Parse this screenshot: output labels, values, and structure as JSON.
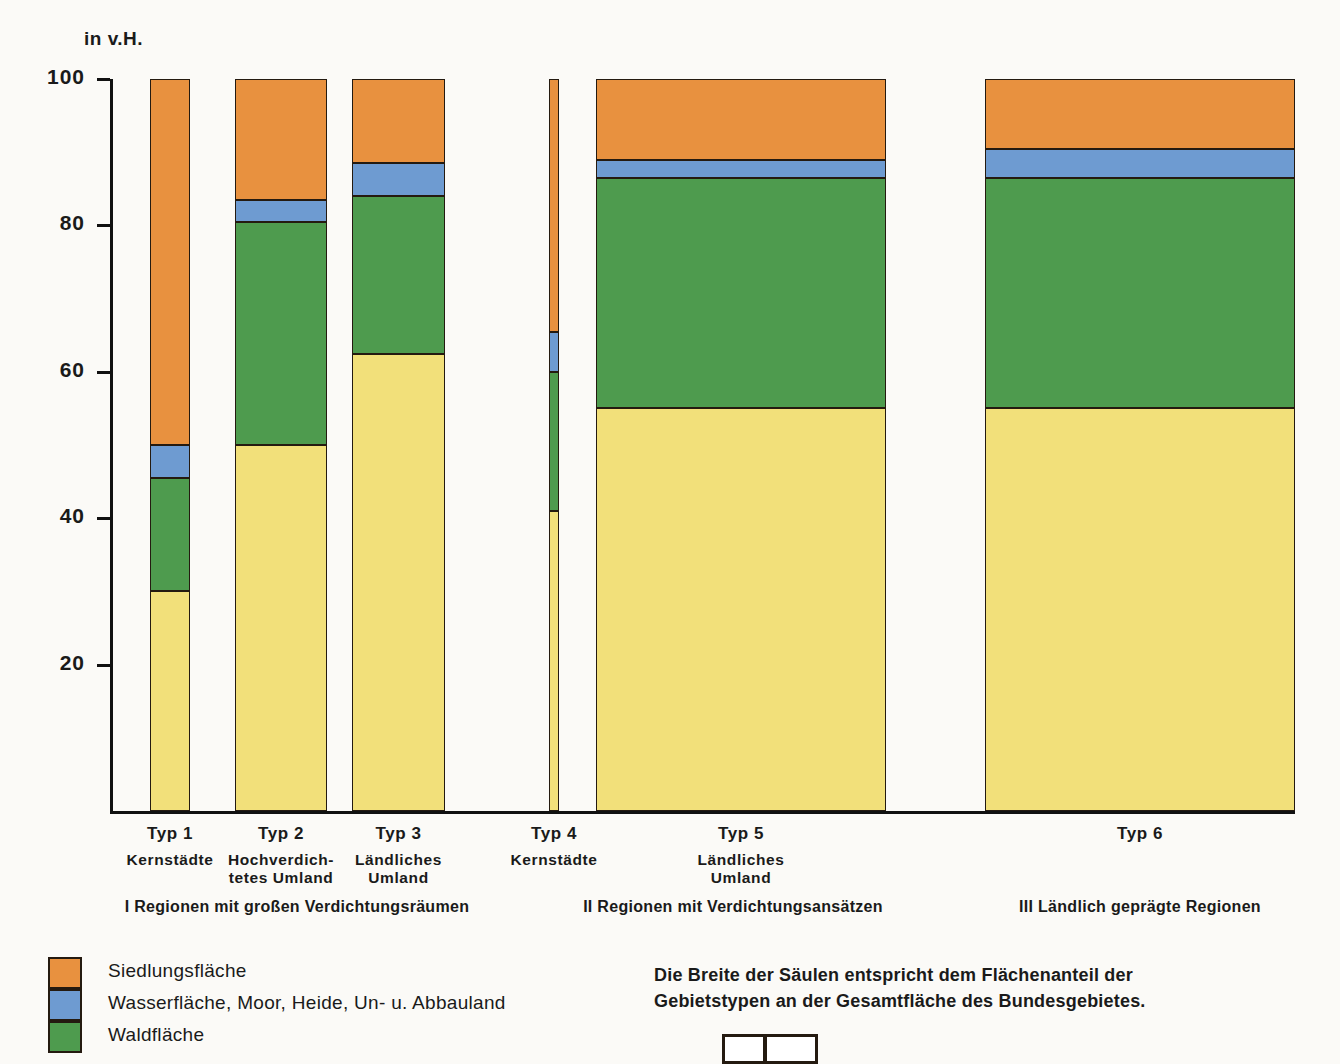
{
  "axis": {
    "unit_label": "in v.H.",
    "y_ticks": [
      "100",
      "80",
      "60",
      "40",
      "20"
    ],
    "y_min": 0,
    "y_max": 100
  },
  "legend": {
    "items": [
      {
        "label": "Siedlungsfläche",
        "color": "#E8913F",
        "key": "siedlung"
      },
      {
        "label": "Wasserfläche, Moor, Heide, Un- u. Abbauland",
        "color": "#6E9BD1",
        "key": "wasser"
      },
      {
        "label": "Waldfläche",
        "color": "#4E9B4E",
        "key": "wald"
      }
    ]
  },
  "note": {
    "text": "Die Breite der Säulen entspricht dem Flächenanteil der\nGebietstypen an der Gesamtfläche des Bundesgebietes."
  },
  "groups": [
    {
      "label": "I Regionen mit großen Verdichtungsräumen"
    },
    {
      "label": "II Regionen mit Verdichtungsansätzen"
    },
    {
      "label": "III Ländlich geprägte Regionen"
    }
  ],
  "chart_data": {
    "type": "bar",
    "title": "",
    "subtitle": "",
    "xlabel": "",
    "ylabel": "in v.H.",
    "ylim": [
      0,
      100
    ],
    "grid": false,
    "legend_position": "bottom-left",
    "stacked": true,
    "variable_bar_width": true,
    "width_meaning": "Die Breite der Säulen entspricht dem Flächenanteil der Gebietstypen an der Gesamtfläche des Bundesgebietes.",
    "categories": [
      "Typ 1",
      "Typ 2",
      "Typ 3",
      "Typ 4",
      "Typ 5",
      "Typ 6"
    ],
    "category_sublabels": [
      "Kernstädte",
      "Hochverdich-\ntetes Umland",
      "Ländliches\nUmland",
      "Kernstädte",
      "Ländliches\nUmland",
      ""
    ],
    "series": [
      {
        "name": "Landwirtschaftsfläche",
        "color": "#F2E07A",
        "values": [
          30.0,
          50.0,
          62.5,
          41.0,
          55.0,
          55.0
        ]
      },
      {
        "name": "Waldfläche",
        "color": "#4E9B4E",
        "values": [
          15.5,
          30.5,
          21.5,
          19.0,
          31.5,
          31.5
        ]
      },
      {
        "name": "Wasserfläche, Moor, Heide, Un- u. Abbauland",
        "color": "#6E9BD1",
        "values": [
          4.5,
          3.0,
          4.5,
          5.5,
          2.5,
          4.0
        ]
      },
      {
        "name": "Siedlungsfläche",
        "color": "#E8913F",
        "values": [
          50.0,
          16.5,
          11.5,
          34.5,
          11.0,
          9.5
        ]
      }
    ],
    "bar_widths_percent_of_area": [
      2.5,
      9.5,
      9.5,
      1.0,
      26.0,
      32.0
    ],
    "groups": [
      {
        "label": "I Regionen mit großen Verdichtungsräumen",
        "categories": [
          "Typ 1",
          "Typ 2",
          "Typ 3"
        ]
      },
      {
        "label": "II Regionen mit Verdichtungsansätzen",
        "categories": [
          "Typ 4",
          "Typ 5"
        ]
      },
      {
        "label": "III Ländlich geprägte Regionen",
        "categories": [
          "Typ 6"
        ]
      }
    ]
  }
}
